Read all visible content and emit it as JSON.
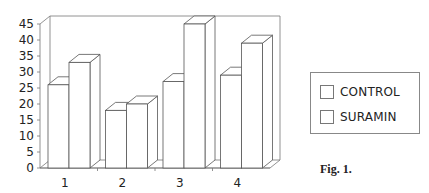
{
  "chart_data": {
    "type": "bar",
    "style": "3d-clustered-column",
    "title": "",
    "xlabel": "",
    "ylabel": "",
    "categories": [
      "1",
      "2",
      "3",
      "4"
    ],
    "series": [
      {
        "name": "CONTROL",
        "values": [
          26,
          18,
          27,
          29
        ]
      },
      {
        "name": "SURAMIN",
        "values": [
          33,
          20,
          45,
          39
        ]
      }
    ],
    "ylim": [
      0,
      45
    ],
    "yticks": [
      0,
      5,
      10,
      15,
      20,
      25,
      30,
      35,
      40,
      45
    ],
    "grid": false,
    "legend_position": "right",
    "colors": {
      "bar_fill": "#ffffff",
      "bar_stroke": "#555555",
      "axis": "#777777"
    }
  },
  "legend": {
    "items": [
      {
        "label": "CONTROL"
      },
      {
        "label": "SURAMIN"
      }
    ]
  },
  "caption": "Fig. 1."
}
